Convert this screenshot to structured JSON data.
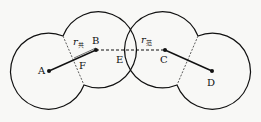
{
  "diagram": {
    "points": {
      "A": {
        "label": "A",
        "x": 49,
        "y": 71
      },
      "B": {
        "label": "B",
        "x": 96,
        "y": 50
      },
      "C": {
        "label": "C",
        "x": 165,
        "y": 50
      },
      "D": {
        "label": "D",
        "x": 212,
        "y": 71
      },
      "E": {
        "label": "E"
      },
      "F": {
        "label": "F"
      }
    },
    "radius_labels": {
      "covalent": {
        "symbol": "r",
        "subscript": "共"
      },
      "vdw": {
        "symbol": "r",
        "subscript": "范"
      }
    },
    "colors": {
      "stroke": "#111111",
      "background": "#f8f8f6"
    }
  }
}
